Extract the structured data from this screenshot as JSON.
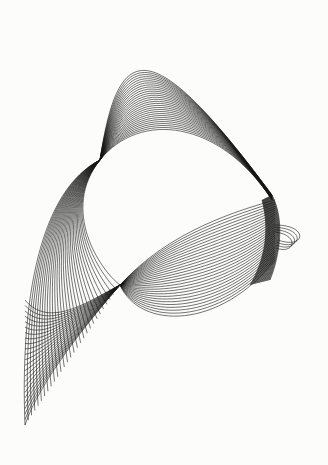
{
  "figure": {
    "background": "#fcfcfb",
    "stroke": "#151515"
  },
  "families": [
    {
      "name": "upper-dome",
      "count": 30,
      "from": [
        [
          100,
          160
        ],
        [
          118,
          40
        ],
        [
          150,
          30
        ],
        [
          272,
          195
        ]
      ],
      "to": [
        [
          100,
          160
        ],
        [
          140,
          110
        ],
        [
          220,
          120
        ],
        [
          272,
          200
        ]
      ]
    },
    {
      "name": "left-ribbon",
      "count": 30,
      "from": [
        [
          100,
          160
        ],
        [
          40,
          190
        ],
        [
          20,
          300
        ],
        [
          25,
          425
        ]
      ],
      "to": [
        [
          100,
          160
        ],
        [
          60,
          210
        ],
        [
          100,
          270
        ],
        [
          120,
          285
        ]
      ]
    },
    {
      "name": "left-fan",
      "count": 24,
      "from": [
        [
          25,
          425
        ],
        [
          40,
          380
        ],
        [
          90,
          320
        ],
        [
          120,
          285
        ]
      ],
      "to": [
        [
          25,
          300
        ],
        [
          50,
          330
        ],
        [
          90,
          300
        ],
        [
          120,
          285
        ]
      ]
    },
    {
      "name": "lower-arc",
      "count": 30,
      "from": [
        [
          120,
          285
        ],
        [
          140,
          330
        ],
        [
          220,
          330
        ],
        [
          275,
          260
        ]
      ],
      "to": [
        [
          120,
          285
        ],
        [
          170,
          230
        ],
        [
          240,
          210
        ],
        [
          275,
          200
        ]
      ]
    },
    {
      "name": "right-band",
      "count": 26,
      "from": [
        [
          272,
          195
        ],
        [
          285,
          220
        ],
        [
          280,
          255
        ],
        [
          270,
          280
        ]
      ],
      "to": [
        [
          262,
          200
        ],
        [
          270,
          230
        ],
        [
          265,
          260
        ],
        [
          250,
          285
        ]
      ]
    },
    {
      "name": "right-loops",
      "count": 4,
      "from": [
        [
          275,
          225
        ],
        [
          310,
          225
        ],
        [
          305,
          250
        ],
        [
          278,
          240
        ]
      ],
      "to": [
        [
          275,
          232
        ],
        [
          300,
          235
        ],
        [
          295,
          255
        ],
        [
          276,
          248
        ]
      ]
    }
  ]
}
